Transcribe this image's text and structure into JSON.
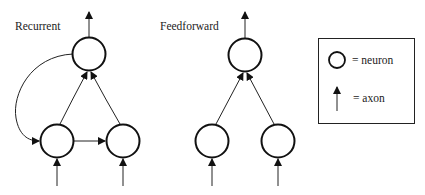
{
  "diagram": {
    "recurrent": {
      "label": "Recurrent",
      "neurons": [
        {
          "id": "r_top",
          "cx": 89,
          "cy": 54
        },
        {
          "id": "r_left",
          "cx": 57,
          "cy": 141
        },
        {
          "id": "r_right",
          "cx": 123,
          "cy": 141
        }
      ],
      "connections": [
        {
          "from": "r_left",
          "to": "r_top"
        },
        {
          "from": "r_right",
          "to": "r_top"
        },
        {
          "from": "r_left",
          "to": "r_right"
        },
        {
          "from": "r_top",
          "to": "r_left",
          "type": "feedback-curve"
        }
      ]
    },
    "feedforward": {
      "label": "Feedforward",
      "neurons": [
        {
          "id": "f_top",
          "cx": 245,
          "cy": 55
        },
        {
          "id": "f_left",
          "cx": 212,
          "cy": 141
        },
        {
          "id": "f_right",
          "cx": 278,
          "cy": 141
        }
      ],
      "connections": [
        {
          "from": "f_left",
          "to": "f_top"
        },
        {
          "from": "f_right",
          "to": "f_top"
        }
      ]
    },
    "legend": {
      "neuron_label": "= neuron",
      "axon_label": "= axon"
    }
  }
}
